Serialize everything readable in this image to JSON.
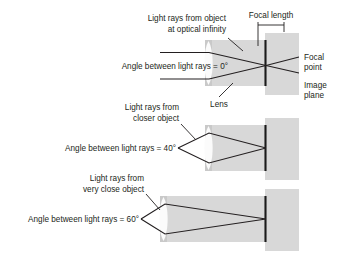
{
  "figure": {
    "colors": {
      "ink": "#231f20",
      "band_gray": "#d8d8d8",
      "lens_gray": "#c9c9c9",
      "lens_white": "#fbfbfb",
      "plane_black": "#1a1a1a",
      "background": "#ffffff"
    }
  },
  "panels": [
    {
      "id": "panel-infinity",
      "object_label_line1": "Light rays from object",
      "object_label_line2": "at optical infinity",
      "angle_label": "Angle between light rays = 0°",
      "angle_value_deg": 0,
      "rays": "parallel"
    },
    {
      "id": "panel-closer",
      "object_label_line1": "Light rays from",
      "object_label_line2": "closer object",
      "angle_label": "Angle between light rays = 40°",
      "angle_value_deg": 40,
      "rays": "diverging"
    },
    {
      "id": "panel-very-close",
      "object_label_line1": "Light rays from",
      "object_label_line2": "very close object",
      "angle_label": "Angle between light rays = 60°",
      "angle_value_deg": 60,
      "rays": "strongly-diverging"
    }
  ],
  "annotations": {
    "focal_length": "Focal length",
    "focal_point_line1": "Focal",
    "focal_point_line2": "point",
    "image_plane_line1": "Image",
    "image_plane_line2": "plane",
    "lens": "Lens"
  }
}
